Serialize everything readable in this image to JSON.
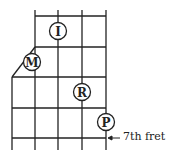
{
  "diagram": {
    "type": "guitar-fretboard-fingering",
    "fingers": [
      {
        "label": "I",
        "name": "index"
      },
      {
        "label": "M",
        "name": "middle"
      },
      {
        "label": "R",
        "name": "ring"
      },
      {
        "label": "P",
        "name": "pinky"
      }
    ],
    "annotation": {
      "arrow": "←",
      "text": "7th  fret"
    },
    "colors": {
      "line": "#222222",
      "background": "#ffffff"
    }
  }
}
